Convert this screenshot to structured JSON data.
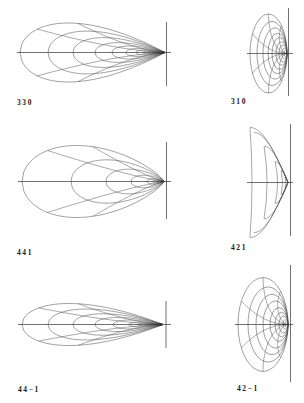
{
  "figure": {
    "panels": [
      {
        "label": "330",
        "shape": "teardrop-family"
      },
      {
        "label": "310",
        "shape": "tangent-ellipse-family"
      },
      {
        "label": "441",
        "shape": "egg-family"
      },
      {
        "label": "421",
        "shape": "chevron-family"
      },
      {
        "label": "44−1",
        "shape": "teardrop-family"
      },
      {
        "label": "42−1",
        "shape": "tangent-ellipse-family"
      }
    ]
  },
  "colors": {
    "background": "#ffffff",
    "curve": "#505050",
    "axis": "#333333",
    "label": "#1a1a1a"
  }
}
